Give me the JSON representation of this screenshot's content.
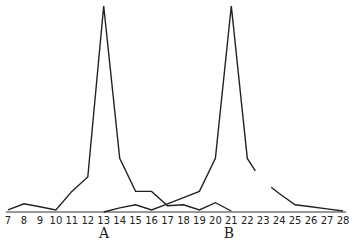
{
  "chart_data": {
    "type": "line",
    "title": "",
    "xlabel": "",
    "ylabel": "",
    "x": [
      7,
      8,
      9,
      10,
      11,
      12,
      13,
      14,
      15,
      16,
      17,
      18,
      19,
      20,
      21,
      22,
      23,
      24,
      25,
      26,
      27,
      28
    ],
    "xlim": [
      7,
      28
    ],
    "ylim": [
      0,
      100
    ],
    "grid": false,
    "legend": null,
    "annotations": [
      {
        "text": "A",
        "x": 13
      },
      {
        "text": "B",
        "x": 21
      }
    ],
    "series": [
      {
        "name": "A",
        "points": [
          [
            7,
            1
          ],
          [
            8,
            4
          ],
          [
            9,
            2.5
          ],
          [
            10,
            1
          ],
          [
            11,
            10
          ],
          [
            12,
            17
          ],
          [
            13,
            100
          ],
          [
            14,
            26
          ],
          [
            15,
            10
          ],
          [
            16,
            10
          ],
          [
            17,
            3
          ],
          [
            18,
            3.5
          ],
          [
            19,
            1
          ],
          [
            20,
            4.5
          ],
          [
            21,
            0.5
          ]
        ]
      },
      {
        "name": "B",
        "points": [
          [
            13,
            0
          ],
          [
            14,
            2
          ],
          [
            15,
            3.5
          ],
          [
            16,
            1
          ],
          [
            17,
            4
          ],
          [
            18,
            7
          ],
          [
            19,
            10
          ],
          [
            20,
            26
          ],
          [
            21,
            100
          ],
          [
            22,
            26
          ],
          [
            22.5,
            20
          ]
        ],
        "points_after_gap": [
          [
            23.5,
            12
          ],
          [
            24,
            9
          ],
          [
            25,
            3.5
          ],
          [
            26,
            2.5
          ],
          [
            27,
            1.5
          ],
          [
            28,
            0.5
          ]
        ]
      }
    ]
  },
  "labels": {
    "ticks": [
      "7",
      "8",
      "9",
      "10",
      "11",
      "12",
      "13",
      "14",
      "15",
      "16",
      "17",
      "18",
      "19",
      "20",
      "21",
      "22",
      "23",
      "24",
      "25",
      "26",
      "27",
      "28"
    ],
    "peak_a": "A",
    "peak_b": "B"
  },
  "colors": {
    "line": "#222222",
    "background": "#ffffff"
  }
}
